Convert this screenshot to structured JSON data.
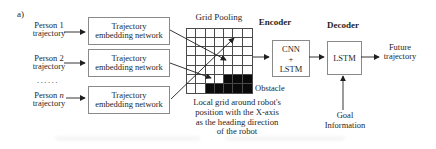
{
  "figure_label": "a)",
  "persons": [
    {
      "name": "Person 1",
      "line2": "trajectory"
    },
    {
      "name": "Person 2",
      "line2": "trajectory"
    },
    {
      "name_prefix": "Person",
      "name_italic": "n",
      "line2": "trajectory"
    }
  ],
  "ellipsis": "......",
  "embedding_box": {
    "line1": "Trajectory",
    "line2": "embedding network"
  },
  "grid": {
    "label": "Grid Pooling",
    "rows": 7,
    "cols": 7,
    "obstacle_cells": [
      [
        5,
        4
      ],
      [
        5,
        5
      ],
      [
        5,
        6
      ],
      [
        6,
        2
      ],
      [
        6,
        3
      ],
      [
        6,
        4
      ],
      [
        6,
        5
      ],
      [
        6,
        6
      ]
    ],
    "obstacle_label": "Obstacle",
    "caption_lines": [
      "Local grid around robot's",
      "position with the X-axis",
      "as the heading direction",
      "of the robot"
    ]
  },
  "encoder": {
    "label": "Encoder",
    "box_lines": [
      "CNN",
      "+",
      "LSTM"
    ]
  },
  "decoder": {
    "label": "Decoder",
    "box_label": "LSTM"
  },
  "output": {
    "line1": "Future",
    "line2": "trajectory"
  },
  "goal": {
    "line1": "Goal",
    "line2": "Information"
  },
  "colors": {
    "text": "#1f1f1f",
    "box_border": "#8a8a8a",
    "grid_line": "#4a4a4a",
    "obstacle": "#0a0a0a",
    "background": "#ffffff"
  }
}
